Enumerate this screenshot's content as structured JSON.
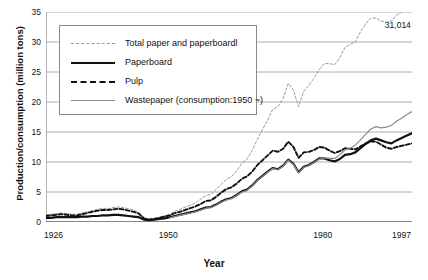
{
  "chart_data": {
    "type": "line",
    "title": "",
    "xlabel": "Year",
    "ylabel": "Production/consumption (million tons)",
    "xlim": [
      1926,
      1997
    ],
    "ylim": [
      0,
      35
    ],
    "yticks": [
      0,
      5,
      10,
      15,
      20,
      25,
      30,
      35
    ],
    "xticks": [
      1926,
      1950,
      1980,
      1997
    ],
    "grid": "horizontal",
    "legend_position": "upper-left",
    "annotations": [
      {
        "text": "31,014",
        "x": 1996,
        "y": 31.0
      }
    ],
    "x": [
      1926,
      1927,
      1928,
      1929,
      1930,
      1931,
      1932,
      1933,
      1934,
      1935,
      1936,
      1937,
      1938,
      1939,
      1940,
      1941,
      1942,
      1943,
      1944,
      1945,
      1946,
      1947,
      1948,
      1949,
      1950,
      1951,
      1952,
      1953,
      1954,
      1955,
      1956,
      1957,
      1958,
      1959,
      1960,
      1961,
      1962,
      1963,
      1964,
      1965,
      1966,
      1967,
      1968,
      1969,
      1970,
      1971,
      1972,
      1973,
      1974,
      1975,
      1976,
      1977,
      1978,
      1979,
      1980,
      1981,
      1982,
      1983,
      1984,
      1985,
      1986,
      1987,
      1988,
      1989,
      1990,
      1991,
      1992,
      1993,
      1994,
      1995,
      1996,
      1997
    ],
    "series": [
      {
        "name": "Total paper and paperboardl",
        "style": "fine-dashed",
        "color": "#9a9a9a",
        "values": [
          1.2,
          1.3,
          1.4,
          1.5,
          1.4,
          1.3,
          1.3,
          1.5,
          1.7,
          1.9,
          2.1,
          2.3,
          2.2,
          2.4,
          2.5,
          2.4,
          2.2,
          2.0,
          1.6,
          0.7,
          0.5,
          0.6,
          0.8,
          1.0,
          1.3,
          1.8,
          2.1,
          2.5,
          2.8,
          3.2,
          3.8,
          4.4,
          4.6,
          5.4,
          6.3,
          7.1,
          7.6,
          8.5,
          9.8,
          10.5,
          11.9,
          13.8,
          15.4,
          17.0,
          18.8,
          19.2,
          20.6,
          23.1,
          22.0,
          19.2,
          21.8,
          22.8,
          24.0,
          25.4,
          26.4,
          26.4,
          26.2,
          27.4,
          29.1,
          29.6,
          30.0,
          31.7,
          33.0,
          34.0,
          34.0,
          33.5,
          33.3,
          33.5,
          34.5,
          35.0,
          36.0,
          37.0
        ]
      },
      {
        "name": "Paperboard",
        "style": "solid-bold",
        "color": "#111111",
        "values": [
          0.7,
          0.7,
          0.8,
          0.8,
          0.8,
          0.8,
          0.8,
          0.9,
          0.9,
          1.0,
          1.0,
          1.1,
          1.1,
          1.2,
          1.2,
          1.1,
          1.0,
          0.9,
          0.8,
          0.4,
          0.3,
          0.4,
          0.5,
          0.6,
          0.8,
          1.0,
          1.2,
          1.4,
          1.6,
          1.8,
          2.1,
          2.4,
          2.5,
          2.9,
          3.4,
          3.8,
          4.0,
          4.5,
          5.1,
          5.4,
          6.1,
          7.0,
          7.7,
          8.4,
          9.0,
          8.8,
          9.4,
          10.4,
          9.7,
          8.3,
          9.2,
          9.5,
          10.0,
          10.6,
          10.6,
          10.3,
          10.1,
          10.5,
          11.2,
          11.3,
          11.6,
          12.3,
          13.0,
          13.6,
          13.9,
          13.6,
          13.3,
          13.1,
          13.6,
          14.0,
          14.4,
          14.8
        ]
      },
      {
        "name": "Pulp",
        "style": "dashed-bold",
        "color": "#111111",
        "values": [
          1.0,
          1.1,
          1.2,
          1.3,
          1.2,
          1.1,
          1.1,
          1.3,
          1.5,
          1.7,
          1.9,
          2.0,
          2.0,
          2.1,
          2.2,
          2.1,
          1.9,
          1.7,
          1.4,
          0.6,
          0.4,
          0.5,
          0.7,
          0.9,
          1.1,
          1.5,
          1.7,
          2.0,
          2.3,
          2.6,
          3.0,
          3.5,
          3.6,
          4.2,
          4.9,
          5.5,
          5.8,
          6.4,
          7.2,
          7.6,
          8.4,
          9.5,
          10.3,
          11.1,
          11.9,
          11.7,
          12.2,
          13.4,
          12.5,
          10.7,
          11.6,
          11.7,
          12.0,
          12.5,
          12.4,
          11.9,
          11.5,
          11.8,
          12.3,
          12.2,
          12.1,
          12.6,
          13.1,
          13.4,
          13.4,
          12.9,
          12.4,
          12.2,
          12.5,
          12.7,
          12.9,
          13.1
        ]
      },
      {
        "name": "Wastepaper (consumption:1950 ~)",
        "style": "solid-thin",
        "color": "#8c8c8c",
        "start_year": 1950,
        "values": [
          null,
          null,
          null,
          null,
          null,
          null,
          null,
          null,
          null,
          null,
          null,
          null,
          null,
          null,
          null,
          null,
          null,
          null,
          null,
          null,
          null,
          null,
          null,
          null,
          0.7,
          0.9,
          1.1,
          1.3,
          1.5,
          1.7,
          2.0,
          2.3,
          2.4,
          2.8,
          3.3,
          3.7,
          3.9,
          4.4,
          5.0,
          5.3,
          6.0,
          6.9,
          7.6,
          8.3,
          8.9,
          8.7,
          9.3,
          10.3,
          9.6,
          8.2,
          9.1,
          9.4,
          9.9,
          10.5,
          10.7,
          10.6,
          10.6,
          11.2,
          12.0,
          12.3,
          12.8,
          13.7,
          14.6,
          15.5,
          15.9,
          15.7,
          15.8,
          16.1,
          16.8,
          17.3,
          17.9,
          18.4
        ]
      }
    ]
  }
}
